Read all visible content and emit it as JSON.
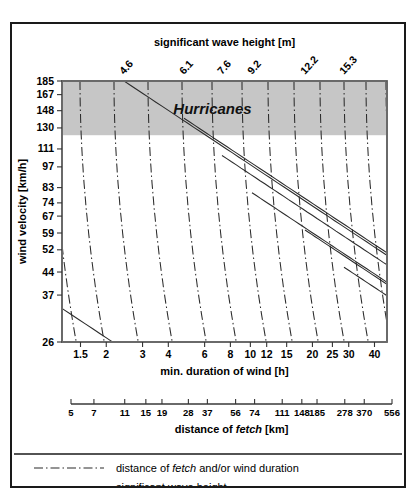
{
  "figure": {
    "credit": "After: ",
    "credit_authors": "Simpson & Riehl",
    "credit_year": ", 1981"
  },
  "legend": {
    "items": [
      {
        "style": "dash-dot",
        "text_pre": "distance of ",
        "text_em": "fetch",
        "text_post": " and/or wind duration"
      },
      {
        "style": "solid",
        "text_pre": "significant wave height",
        "text_em": "",
        "text_post": ""
      }
    ]
  },
  "band": {
    "label": "Hurricanes",
    "y_top_value": 185,
    "y_bottom_value": 124,
    "color": "#c6c6c6"
  },
  "chart_data": {
    "type": "line",
    "title": "significant wave height [m]",
    "subtitle": "",
    "xlabel": "min. duration of wind [h]",
    "xlabel2": "distance of fetch [km]",
    "ylabel": "wind velocity [km/h]",
    "x_scale": "log",
    "y_scale": "log",
    "xlim": [
      1.2,
      45
    ],
    "ylim": [
      26,
      185
    ],
    "grid": false,
    "legend_position": "below-plot",
    "top_axis": {
      "label": "significant wave height [m]",
      "tick_labels": [
        "4.6",
        "6.1",
        "7.6",
        "9.2",
        "12.2",
        "15.3"
      ],
      "tick_rotation_deg": -45
    },
    "y_axis": {
      "label": "wind velocity [km/h]",
      "tick_labels": [
        185,
        167,
        148,
        130,
        111,
        97,
        83,
        74,
        67,
        59,
        52,
        44,
        37,
        26
      ]
    },
    "x_axis_duration": {
      "label": "min. duration of wind [h]",
      "tick_labels": [
        "1.5",
        "2",
        "3",
        "4",
        "6",
        "8",
        "10",
        "12",
        "15",
        "20",
        "25",
        "30",
        "40"
      ]
    },
    "x_axis_fetch": {
      "label": "distance of fetch [km]",
      "tick_labels": [
        "5",
        "7",
        "11",
        "15",
        "19",
        "28",
        "37",
        "56",
        "74",
        "111",
        "148",
        "185",
        "278",
        "370",
        "556"
      ]
    },
    "series": [
      {
        "name": "significant wave height 4.6 m",
        "style": "solid",
        "value": 4.6
      },
      {
        "name": "significant wave height 6.1 m",
        "style": "solid",
        "value": 6.1
      },
      {
        "name": "significant wave height 7.6 m",
        "style": "solid",
        "value": 7.6
      },
      {
        "name": "significant wave height 9.2 m",
        "style": "solid",
        "value": 9.2
      },
      {
        "name": "significant wave height 12.2 m",
        "style": "solid",
        "value": 12.2
      },
      {
        "name": "significant wave height 15.3 m",
        "style": "solid",
        "value": 15.3
      },
      {
        "name": "fetch / duration isolines",
        "style": "dash-dot",
        "value": null
      }
    ]
  }
}
